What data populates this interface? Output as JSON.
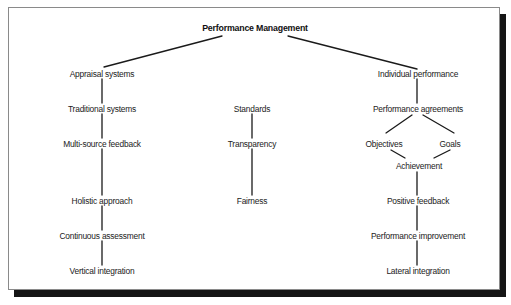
{
  "diagram": {
    "title": "Performance Management",
    "colors": {
      "line": "#1a1a1a",
      "text": "#222222",
      "frame_border": "#8a8a8a",
      "shadow": "#151515",
      "background": "#ffffff"
    },
    "left_branch": {
      "root": "Appraisal systems",
      "items": [
        "Traditional systems",
        "Multi-source feedback",
        "Holistic approach",
        "Continuous assessment",
        "Vertical integration"
      ]
    },
    "middle_branch": {
      "items": [
        "Standards",
        "Transparency",
        "Fairness"
      ]
    },
    "right_branch": {
      "root": "Individual performance",
      "agreements": "Performance agreements",
      "split": [
        "Objectives",
        "Goals"
      ],
      "merge": "Achievement",
      "items": [
        "Positive feedback",
        "Performance improvement",
        "Lateral integration"
      ]
    }
  }
}
